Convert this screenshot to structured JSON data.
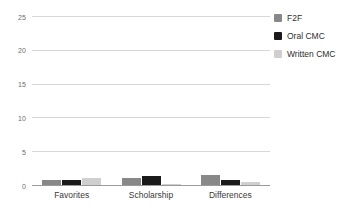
{
  "chart_data": {
    "type": "bar",
    "title": "",
    "xlabel": "",
    "ylabel": "",
    "categories": [
      "Favorites",
      "Scholarship",
      "Differences"
    ],
    "series": [
      {
        "name": "F2F",
        "color": "#888888",
        "values": [
          0.8,
          1.0,
          1.5
        ]
      },
      {
        "name": "Oral CMC",
        "color": "#1a1a1a",
        "values": [
          0.7,
          1.3,
          0.8
        ]
      },
      {
        "name": "Written CMC",
        "color": "#cfcfcf",
        "values": [
          1.0,
          0.1,
          0.4
        ]
      }
    ],
    "ylim": [
      0,
      25
    ],
    "yticks": [
      0,
      5,
      10,
      15,
      20,
      25
    ],
    "ytick_labels": [
      "0",
      "5",
      "10",
      "15",
      "20",
      "25"
    ],
    "grid": true,
    "legend_position": "right"
  },
  "legend": {
    "entries": [
      {
        "label": "F2F",
        "color": "#888888"
      },
      {
        "label": "Oral CMC",
        "color": "#1a1a1a"
      },
      {
        "label": "Written CMC",
        "color": "#cfcfcf"
      }
    ]
  },
  "axis": {
    "y_tick_labels": [
      "25",
      "20",
      "15",
      "10",
      "5",
      "0"
    ],
    "x_tick_labels": [
      "Favorites",
      "Scholarship",
      "Differences"
    ]
  },
  "colors": {
    "gridline": "#d8d8d8",
    "baseline": "#9a9a9a",
    "text": "#3a3a3a",
    "tick_text": "#6e6e6e"
  }
}
